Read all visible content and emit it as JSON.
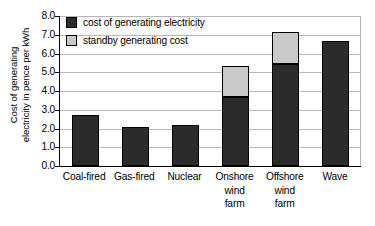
{
  "chart_data": {
    "type": "bar",
    "stacked": true,
    "title": "",
    "xlabel": "",
    "ylabel": "Cost of generating electricity in pence per kWh",
    "ylabel_lines": [
      "Cost of generating",
      "electricity in pence per kWh"
    ],
    "ylim": [
      0.0,
      8.0
    ],
    "ytick_step": 1.0,
    "ytick_labels": [
      "8.0",
      "7.0",
      "6.0",
      "5.0",
      "4.0",
      "3.0",
      "2.0",
      "1.0",
      "0.0"
    ],
    "ytick_values": [
      8.0,
      7.0,
      6.0,
      5.0,
      4.0,
      3.0,
      2.0,
      1.0,
      0.0
    ],
    "grid": true,
    "grid_axis": "y",
    "legend_position": "top-left",
    "categories": [
      "Coal-fired",
      "Gas-fired",
      "Nuclear",
      "Onshore wind farm",
      "Offshore wind farm",
      "Wave"
    ],
    "category_lines": [
      [
        "Coal-fired"
      ],
      [
        "Gas-fired"
      ],
      [
        "Nuclear"
      ],
      [
        "Onshore",
        "wind",
        "farm"
      ],
      [
        "Offshore",
        "wind",
        "farm"
      ],
      [
        "Wave"
      ]
    ],
    "series": [
      {
        "name": "cost of generating electricity",
        "color": "#2b2b2b",
        "values": [
          2.7,
          2.1,
          2.2,
          3.7,
          5.45,
          6.65
        ]
      },
      {
        "name": "standby generating cost",
        "color": "#c9c9c9",
        "values": [
          0.0,
          0.0,
          0.0,
          1.65,
          1.7,
          0.0
        ]
      }
    ],
    "totals": [
      2.7,
      2.1,
      2.2,
      5.35,
      7.15,
      6.65
    ]
  },
  "legend": {
    "items": [
      {
        "label": "cost of generating electricity",
        "color": "#2b2b2b"
      },
      {
        "label": "standby generating cost",
        "color": "#c9c9c9"
      }
    ]
  },
  "colors": {
    "series_main": "#2b2b2b",
    "series_standby": "#c9c9c9",
    "grid": "#b8b8b8",
    "axis": "#000000",
    "background": "#ffffff"
  }
}
